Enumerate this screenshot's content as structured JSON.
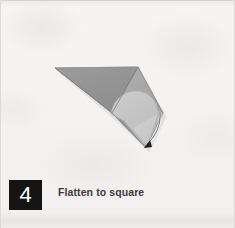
{
  "page": {
    "width": 235,
    "height": 228,
    "background_color": "#f3f2f0",
    "kind": "instructional-step-panel"
  },
  "step": {
    "number": "4",
    "caption": "Flatten to square",
    "badge_background_color": "#141414",
    "badge_text_color": "#ffffff",
    "caption_color": "#3b3b3b"
  },
  "illustration": {
    "name": "origami-fold-diagram",
    "description": "Flat gray paper model folded into a triangular flap with a rounded inner flap and a small curved arrow at the lower tip",
    "colors": {
      "flap_dark": "#939393",
      "flap_mid": "#a8a8a8",
      "flap_light": "#c3c3c3",
      "flap_lighter": "#cfcfcf",
      "fold_line": "#7c7c7c",
      "outline": "#8a8a8a",
      "arrow": "#2b2b2b",
      "shadow": "rgba(120,120,120,0.35)"
    },
    "geometry": {
      "top_left_apex": [
        55,
        68
      ],
      "top_apex": [
        138,
        67
      ],
      "right_apex": [
        163,
        113
      ],
      "bottom_tip": [
        146,
        148
      ],
      "inner_curve_left": [
        110,
        112
      ],
      "inner_curve_peak": [
        137,
        93
      ]
    },
    "arrow": {
      "name": "fold-direction-arrow",
      "from": [
        158,
        118
      ],
      "to": [
        145,
        146
      ],
      "head_direction": "down-left"
    }
  }
}
